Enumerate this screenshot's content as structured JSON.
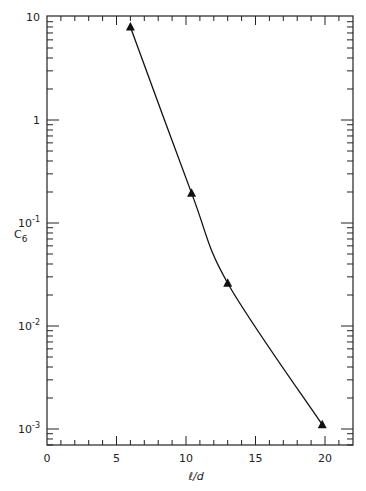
{
  "chart_data": {
    "type": "line",
    "title": "",
    "xlabel": "ℓ/d",
    "ylabel": "C6",
    "ylabel_main": "C",
    "ylabel_sub": "6",
    "xlim": [
      0,
      22
    ],
    "ylim": [
      0.0007,
      10
    ],
    "yscale": "log",
    "x_ticks": [
      0,
      5,
      10,
      15,
      20
    ],
    "x_tick_labels": [
      "0",
      "5",
      "10",
      "15",
      "20"
    ],
    "y_ticks": [
      10,
      1,
      0.1,
      0.01,
      0.001
    ],
    "y_tick_labels": [
      {
        "base": "10",
        "exp": ""
      },
      {
        "base": "1",
        "exp": ""
      },
      {
        "base": "10",
        "exp": "-1"
      },
      {
        "base": "10",
        "exp": "-2"
      },
      {
        "base": "10",
        "exp": "-3"
      }
    ],
    "grid": false,
    "legend": null,
    "series": [
      {
        "name": "C6",
        "marker": "triangle",
        "x": [
          6.0,
          10.4,
          13.0,
          19.8
        ],
        "values": [
          8.0,
          0.195,
          0.026,
          0.0011
        ]
      }
    ]
  }
}
